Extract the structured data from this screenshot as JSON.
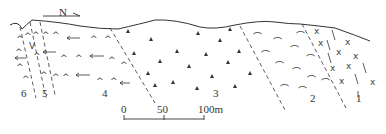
{
  "diagram": {
    "type": "geological-cross-section",
    "north_arrow": {
      "label": "N"
    },
    "scale_bar": {
      "ticks": [
        "0",
        "50",
        "100m"
      ]
    },
    "zones": [
      {
        "id": "1",
        "label": "1",
        "symbol": "x-and-slash"
      },
      {
        "id": "2",
        "label": "2",
        "symbol": "arc"
      },
      {
        "id": "3",
        "label": "3",
        "symbol": "filled-triangle"
      },
      {
        "id": "4",
        "label": "4",
        "symbol": "caret-with-arrows"
      },
      {
        "id": "5",
        "label": "5",
        "symbol": "caret-v-dashed"
      },
      {
        "id": "6",
        "label": "6",
        "symbol": "caret"
      }
    ]
  }
}
